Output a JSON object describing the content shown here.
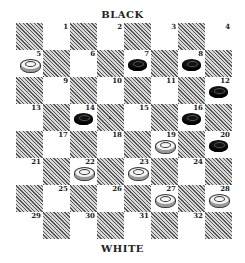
{
  "labels": {
    "top": "BLACK",
    "bottom": "WHITE"
  },
  "board": {
    "size": 8,
    "squares": [
      {
        "n": 1,
        "row": 0,
        "col": 1
      },
      {
        "n": 2,
        "row": 0,
        "col": 3
      },
      {
        "n": 3,
        "row": 0,
        "col": 5
      },
      {
        "n": 4,
        "row": 0,
        "col": 7
      },
      {
        "n": 5,
        "row": 1,
        "col": 0
      },
      {
        "n": 6,
        "row": 1,
        "col": 2
      },
      {
        "n": 7,
        "row": 1,
        "col": 4
      },
      {
        "n": 8,
        "row": 1,
        "col": 6
      },
      {
        "n": 9,
        "row": 2,
        "col": 1
      },
      {
        "n": 10,
        "row": 2,
        "col": 3
      },
      {
        "n": 11,
        "row": 2,
        "col": 5
      },
      {
        "n": 12,
        "row": 2,
        "col": 7
      },
      {
        "n": 13,
        "row": 3,
        "col": 0
      },
      {
        "n": 14,
        "row": 3,
        "col": 2
      },
      {
        "n": 15,
        "row": 3,
        "col": 4
      },
      {
        "n": 16,
        "row": 3,
        "col": 6
      },
      {
        "n": 17,
        "row": 4,
        "col": 1
      },
      {
        "n": 18,
        "row": 4,
        "col": 3
      },
      {
        "n": 19,
        "row": 4,
        "col": 5
      },
      {
        "n": 20,
        "row": 4,
        "col": 7
      },
      {
        "n": 21,
        "row": 5,
        "col": 0
      },
      {
        "n": 22,
        "row": 5,
        "col": 2
      },
      {
        "n": 23,
        "row": 5,
        "col": 4
      },
      {
        "n": 24,
        "row": 5,
        "col": 6
      },
      {
        "n": 25,
        "row": 6,
        "col": 1
      },
      {
        "n": 26,
        "row": 6,
        "col": 3
      },
      {
        "n": 27,
        "row": 6,
        "col": 5
      },
      {
        "n": 28,
        "row": 6,
        "col": 7
      },
      {
        "n": 29,
        "row": 7,
        "col": 0
      },
      {
        "n": 30,
        "row": 7,
        "col": 2
      },
      {
        "n": 31,
        "row": 7,
        "col": 4
      },
      {
        "n": 32,
        "row": 7,
        "col": 6
      }
    ],
    "pieces": {
      "black": [
        7,
        8,
        12,
        14,
        16,
        20
      ],
      "white": [
        5,
        19,
        22,
        23,
        27,
        28
      ]
    },
    "marker": {
      "row": 3,
      "col": 3
    }
  }
}
